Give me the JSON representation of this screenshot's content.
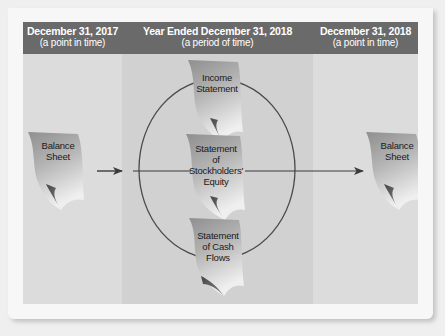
{
  "header": {
    "columns": [
      {
        "title": "December 31, 2017",
        "subtitle": "(a point in time)"
      },
      {
        "title": "Year Ended December 31, 2018",
        "subtitle": "(a period of time)"
      },
      {
        "title": "December 31, 2018",
        "subtitle": "(a point in time)"
      }
    ]
  },
  "documents": {
    "balance_sheet_start": {
      "line1": "Balance",
      "line2": "Sheet"
    },
    "income_statement": {
      "line1": "Income",
      "line2": "Statement"
    },
    "stockholders_equity": {
      "line1": "Statement",
      "line2": "of",
      "line3": "Stockholders'",
      "line4": "Equity"
    },
    "cash_flows": {
      "line1": "Statement",
      "line2": "of Cash",
      "line3": "Flows"
    },
    "balance_sheet_end": {
      "line1": "Balance",
      "line2": "Sheet"
    }
  },
  "colors": {
    "header_bg": "#6a6a6a",
    "panel_bg": "#dcdcdc",
    "center_col_bg": "#d1d1d1",
    "doc_dark": "#9a9a9a",
    "doc_light": "#ececec",
    "line": "#3a3a3a"
  }
}
